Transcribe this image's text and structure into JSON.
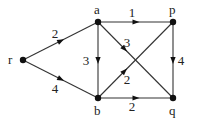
{
  "graph": {
    "nodes": [
      {
        "id": "r",
        "label": "r",
        "x": 23,
        "y": 60,
        "lx": 8,
        "ly": 64
      },
      {
        "id": "a",
        "label": "a",
        "x": 98,
        "y": 22,
        "lx": 94,
        "ly": 14
      },
      {
        "id": "p",
        "label": "p",
        "x": 173,
        "y": 22,
        "lx": 169,
        "ly": 14
      },
      {
        "id": "b",
        "label": "b",
        "x": 98,
        "y": 98,
        "lx": 94,
        "ly": 115
      },
      {
        "id": "q",
        "label": "q",
        "x": 173,
        "y": 98,
        "lx": 169,
        "ly": 115
      }
    ],
    "edges": [
      {
        "from": "r",
        "to": "a",
        "weight": "2",
        "wx": 55,
        "wy": 38
      },
      {
        "from": "r",
        "to": "b",
        "weight": "4",
        "wx": 55,
        "wy": 93
      },
      {
        "from": "a",
        "to": "p",
        "weight": "1",
        "wx": 132,
        "wy": 17
      },
      {
        "from": "a",
        "to": "b",
        "weight": "3",
        "wx": 86,
        "wy": 65
      },
      {
        "from": "p",
        "to": "q",
        "weight": "4",
        "wx": 181,
        "wy": 65
      },
      {
        "from": "b",
        "to": "q",
        "weight": "2",
        "wx": 132,
        "wy": 111
      },
      {
        "from": "a",
        "to": "q",
        "weight": "3",
        "wx": 127,
        "wy": 47
      },
      {
        "from": "b",
        "to": "p",
        "weight": "2",
        "wx": 127,
        "wy": 84
      }
    ]
  }
}
